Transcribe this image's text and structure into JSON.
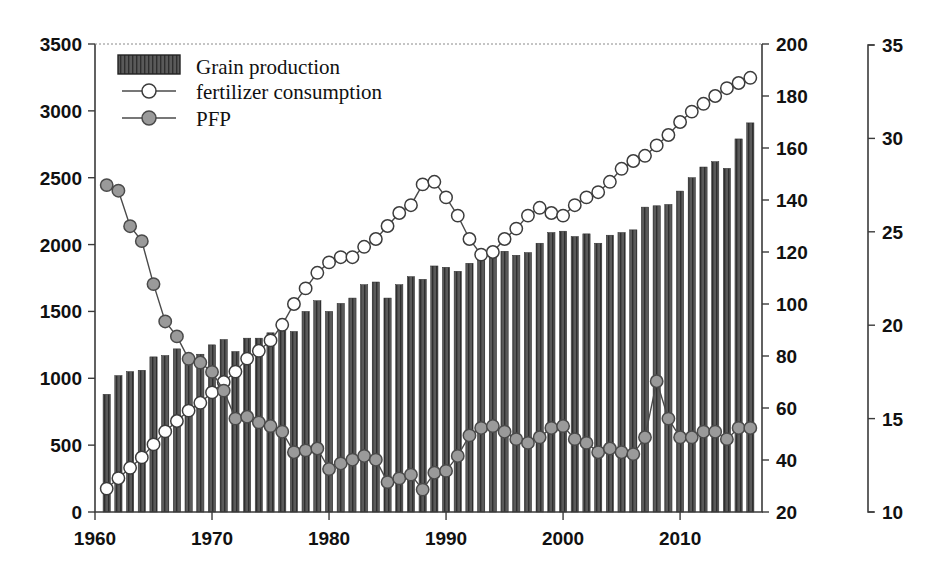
{
  "chart_data": {
    "type": "bar",
    "title": "",
    "subtitle": "",
    "xlabel": "",
    "ylabel": "",
    "grid": false,
    "legend_position": "top-left",
    "x": [
      1961,
      1962,
      1963,
      1964,
      1965,
      1966,
      1967,
      1968,
      1969,
      1970,
      1971,
      1972,
      1973,
      1974,
      1975,
      1976,
      1977,
      1978,
      1979,
      1980,
      1981,
      1982,
      1983,
      1984,
      1985,
      1986,
      1987,
      1988,
      1989,
      1990,
      1991,
      1992,
      1993,
      1994,
      1995,
      1996,
      1997,
      1998,
      1999,
      2000,
      2001,
      2002,
      2003,
      2004,
      2005,
      2006,
      2007,
      2008,
      2009,
      2010,
      2011,
      2012,
      2013,
      2014,
      2015,
      2016
    ],
    "xlim": [
      1960,
      2017
    ],
    "xticks": [
      1960,
      1970,
      1980,
      1990,
      2000,
      2010
    ],
    "xticklabels": [
      "1960",
      "1970",
      "1980",
      "1990",
      "2000",
      "2010"
    ],
    "axes": [
      {
        "name": "left",
        "label": "",
        "lim": [
          0,
          3500
        ],
        "ticks": [
          0,
          500,
          1000,
          1500,
          2000,
          2500,
          3000,
          3500
        ],
        "ticklabels": [
          "0",
          "500",
          "1000",
          "1500",
          "2000",
          "2500",
          "3000",
          "3500"
        ],
        "series": [
          "Grain production"
        ]
      },
      {
        "name": "right-inner",
        "label": "",
        "lim": [
          20,
          200
        ],
        "ticks": [
          20,
          40,
          60,
          80,
          100,
          120,
          140,
          160,
          180,
          200
        ],
        "ticklabels": [
          "20",
          "40",
          "60",
          "80",
          "100",
          "120",
          "140",
          "160",
          "180",
          "200"
        ],
        "series": [
          "fertilizer consumption"
        ]
      },
      {
        "name": "right-outer",
        "label": "",
        "lim": [
          10,
          35
        ],
        "ticks": [
          10,
          15,
          20,
          25,
          30,
          35
        ],
        "ticklabels": [
          "10",
          "15",
          "20",
          "25",
          "30",
          "35"
        ],
        "series": [
          "PFP"
        ]
      }
    ],
    "series": [
      {
        "name": "Grain production",
        "type": "bar",
        "axis": "left",
        "color": "#555555",
        "pattern": "vertical-hatch",
        "values": [
          880,
          1020,
          1050,
          1060,
          1160,
          1170,
          1220,
          1170,
          1180,
          1250,
          1290,
          1200,
          1300,
          1300,
          1340,
          1380,
          1350,
          1500,
          1580,
          1500,
          1560,
          1600,
          1700,
          1720,
          1600,
          1700,
          1760,
          1740,
          1840,
          1830,
          1800,
          1860,
          1880,
          1950,
          1950,
          1920,
          1940,
          2010,
          2090,
          2100,
          2060,
          2080,
          2010,
          2070,
          2090,
          2110,
          2280,
          2290,
          2300,
          2400,
          2500,
          2580,
          2620,
          2570,
          2790,
          2910
        ]
      },
      {
        "name": "fertilizer consumption",
        "type": "line",
        "axis": "right-inner",
        "marker": "open-circle",
        "marker_color": "#ffffff",
        "line_color": "#4a4a4a",
        "values": [
          29,
          33,
          37,
          41,
          46,
          51,
          55,
          59,
          62,
          66,
          70,
          74,
          79,
          82,
          86,
          92,
          100,
          106,
          112,
          116,
          118,
          118,
          122,
          125,
          130,
          135,
          138,
          146,
          147,
          141,
          134,
          125,
          119,
          120,
          125,
          129,
          134,
          137,
          135,
          134,
          138,
          141,
          143,
          147,
          152,
          155,
          157,
          161,
          165,
          170,
          174,
          177,
          180,
          183,
          185,
          187
        ]
      },
      {
        "name": "PFP",
        "type": "line",
        "axis": "right-outer",
        "marker": "filled-circle",
        "marker_color": "#9a9a9a",
        "line_color": "#4a4a4a",
        "values": [
          27.5,
          27.2,
          25.3,
          24.5,
          22.2,
          20.2,
          19.4,
          18.2,
          18.0,
          17.5,
          16.5,
          15.0,
          15.1,
          14.8,
          14.6,
          14.3,
          13.2,
          13.3,
          13.4,
          12.3,
          12.6,
          12.8,
          13.0,
          12.8,
          11.6,
          11.8,
          12.0,
          11.2,
          12.1,
          12.2,
          13.0,
          14.1,
          14.5,
          14.6,
          14.3,
          13.9,
          13.7,
          14.0,
          14.5,
          14.6,
          13.9,
          13.7,
          13.2,
          13.4,
          13.2,
          13.1,
          14.0,
          17.0,
          15.0,
          14.0,
          14.0,
          14.3,
          14.3,
          13.9,
          14.5,
          14.5
        ]
      }
    ],
    "legend": [
      {
        "label": "Grain production",
        "swatch": "bar-swatch"
      },
      {
        "label": "fertilizer consumption",
        "swatch": "open-circle-line"
      },
      {
        "label": "PFP",
        "swatch": "gray-circle-line"
      }
    ]
  }
}
